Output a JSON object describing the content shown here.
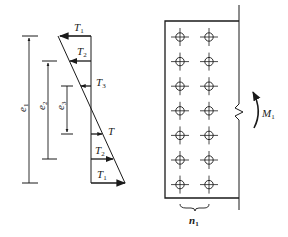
{
  "diagram": {
    "left": {
      "forces": [
        {
          "name": "T",
          "sub": "1",
          "direction": "left"
        },
        {
          "name": "T",
          "sub": "2",
          "direction": "left"
        },
        {
          "name": "T",
          "sub": "3",
          "direction": "left"
        },
        {
          "name": "T",
          "sub": "",
          "direction": "right"
        },
        {
          "name": "T",
          "sub": "2",
          "direction": "right"
        },
        {
          "name": "T",
          "sub": "1",
          "direction": "right"
        }
      ],
      "dimensions": [
        {
          "name": "e",
          "sub": "1"
        },
        {
          "name": "e",
          "sub": "2"
        },
        {
          "name": "e",
          "sub": "3"
        }
      ]
    },
    "right": {
      "bolt_columns": 2,
      "bolt_rows": 7,
      "moment": {
        "name": "M",
        "sub": "1"
      },
      "count_label": {
        "name": "n",
        "sub": "1"
      }
    }
  }
}
